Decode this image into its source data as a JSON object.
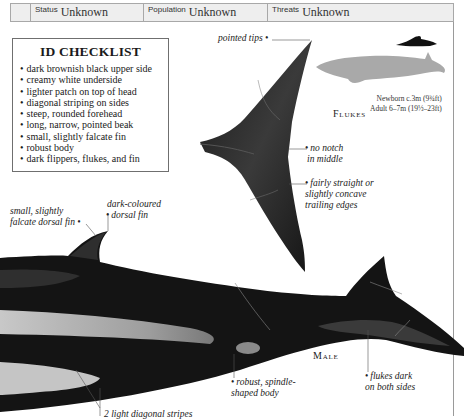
{
  "header": {
    "fields": [
      {
        "label": "Status",
        "value": "Unknown"
      },
      {
        "label": "Population",
        "value": "Unknown"
      },
      {
        "label": "Threats",
        "value": "Unknown"
      }
    ]
  },
  "checklist": {
    "title": "ID CHECKLIST",
    "items": [
      "dark brownish black upper side",
      "creamy white underside",
      "lighter patch on top of head",
      "diagonal striping on sides",
      "steep, rounded forehead",
      "long, narrow, pointed beak",
      "small, slightly falcate fin",
      "robust body",
      "dark flippers, flukes, and fin"
    ]
  },
  "flukes": {
    "caption": "Flukes",
    "annotations": {
      "pointed_tips": "pointed tips",
      "no_notch_1": "no notch",
      "no_notch_2": "in middle",
      "trailing_1": "fairly straight or",
      "trailing_2": "slightly concave",
      "trailing_3": "trailing edges"
    }
  },
  "size_comparison": {
    "newborn": "Newborn c.3m (9¾ft)",
    "adult": "Adult 6–7m (19½–23ft)",
    "icons": [
      "human-swimmer-silhouette",
      "whale-silhouette"
    ]
  },
  "male": {
    "caption": "Male",
    "annotations": {
      "dorsal_small_1": "small, slightly",
      "dorsal_small_2": "falcate dorsal fin",
      "dorsal_dark_1": "dark-coloured",
      "dorsal_dark_2": "dorsal fin",
      "body_1": "robust, spindle-",
      "body_2": "shaped body",
      "flukes_1": "flukes dark",
      "flukes_2": "on both sides",
      "stripes": "2 light diagonal stripes"
    }
  },
  "colors": {
    "whale_body": "#141414",
    "stripe": "#c8c8c8",
    "silhouette": "#a9a9a9",
    "header_bg": "#eeeeee",
    "border": "#a8a8a8"
  }
}
